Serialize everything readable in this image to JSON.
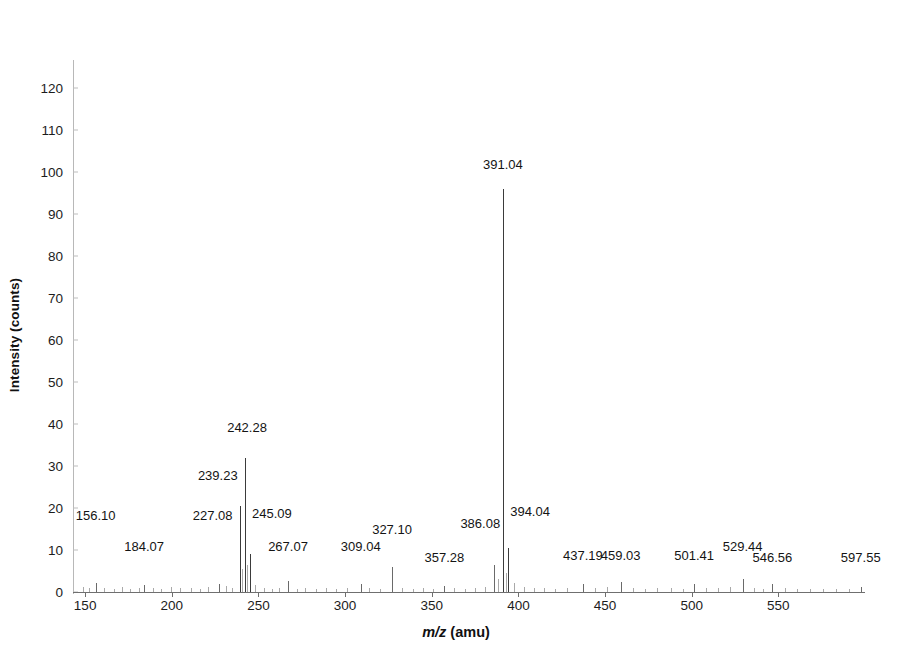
{
  "chart_data": {
    "type": "bar",
    "title": "",
    "subtitle": "",
    "xlabel": "m/z (amu)",
    "xlabel_italic_part": "m/z",
    "xlabel_plain_part": " (amu)",
    "ylabel": "Intensity (counts)",
    "xlim": [
      143,
      600
    ],
    "ylim": [
      0,
      125
    ],
    "x_ticks": [
      150,
      200,
      250,
      300,
      350,
      400,
      450,
      500,
      550
    ],
    "y_ticks": [
      0,
      10,
      20,
      30,
      40,
      50,
      60,
      70,
      80,
      90,
      100,
      110,
      120
    ],
    "grid": false,
    "legend": null,
    "peaks": [
      {
        "mz": 156.1,
        "intensity": 2.2,
        "label": "156.10",
        "label_y": 16.5,
        "label_dx": 0
      },
      {
        "mz": 184.07,
        "intensity": 1.6,
        "label": "184.07",
        "label_y": 9.0,
        "label_dx": 0
      },
      {
        "mz": 227.08,
        "intensity": 2.0,
        "label": "227.08",
        "label_y": 16.5,
        "label_dx": -6
      },
      {
        "mz": 239.23,
        "intensity": 20.5,
        "label": "239.23",
        "label_y": 26.0,
        "label_dx": -22
      },
      {
        "mz": 242.28,
        "intensity": 31.8,
        "label": "242.28",
        "label_y": 37.5,
        "label_dx": 2
      },
      {
        "mz": 245.09,
        "intensity": 9.0,
        "label": "245.09",
        "label_y": 17.0,
        "label_dx": 22
      },
      {
        "mz": 267.07,
        "intensity": 2.6,
        "label": "267.07",
        "label_y": 9.0,
        "label_dx": 0
      },
      {
        "mz": 309.04,
        "intensity": 1.8,
        "label": "309.04",
        "label_y": 9.0,
        "label_dx": 0
      },
      {
        "mz": 327.1,
        "intensity": 6.0,
        "label": "327.10",
        "label_y": 13.0,
        "label_dx": 0
      },
      {
        "mz": 357.28,
        "intensity": 1.5,
        "label": "357.28",
        "label_y": 6.5,
        "label_dx": 0
      },
      {
        "mz": 386.08,
        "intensity": 6.5,
        "label": "386.08",
        "label_y": 14.5,
        "label_dx": -14
      },
      {
        "mz": 391.04,
        "intensity": 96.0,
        "label": "391.04",
        "label_y": 100.0,
        "label_dx": 0
      },
      {
        "mz": 394.04,
        "intensity": 10.5,
        "label": "394.04",
        "label_y": 17.5,
        "label_dx": 22
      },
      {
        "mz": 437.19,
        "intensity": 2.0,
        "label": "437.19",
        "label_y": 7.0,
        "label_dx": 0
      },
      {
        "mz": 459.03,
        "intensity": 2.4,
        "label": "459.03",
        "label_y": 7.0,
        "label_dx": 0
      },
      {
        "mz": 501.41,
        "intensity": 1.8,
        "label": "501.41",
        "label_y": 7.0,
        "label_dx": 0
      },
      {
        "mz": 529.44,
        "intensity": 3.2,
        "label": "529.44",
        "label_y": 9.0,
        "label_dx": 0
      },
      {
        "mz": 546.56,
        "intensity": 2.0,
        "label": "546.56",
        "label_y": 6.5,
        "label_dx": 0
      },
      {
        "mz": 597.55,
        "intensity": 1.2,
        "label": "597.55",
        "label_y": 6.5,
        "label_dx": 0
      }
    ],
    "minor_peaks": [
      {
        "mz": 148.5,
        "intensity": 1.1
      },
      {
        "mz": 152.0,
        "intensity": 0.9
      },
      {
        "mz": 161.0,
        "intensity": 1.0
      },
      {
        "mz": 166.5,
        "intensity": 0.8
      },
      {
        "mz": 171.0,
        "intensity": 1.2
      },
      {
        "mz": 176.0,
        "intensity": 0.7
      },
      {
        "mz": 181.0,
        "intensity": 0.9
      },
      {
        "mz": 189.0,
        "intensity": 1.0
      },
      {
        "mz": 194.0,
        "intensity": 0.8
      },
      {
        "mz": 199.5,
        "intensity": 1.1
      },
      {
        "mz": 205.0,
        "intensity": 0.9
      },
      {
        "mz": 211.0,
        "intensity": 1.0
      },
      {
        "mz": 216.0,
        "intensity": 0.8
      },
      {
        "mz": 221.0,
        "intensity": 1.2
      },
      {
        "mz": 231.0,
        "intensity": 1.4
      },
      {
        "mz": 235.0,
        "intensity": 1.0
      },
      {
        "mz": 240.6,
        "intensity": 5.5
      },
      {
        "mz": 243.6,
        "intensity": 6.5
      },
      {
        "mz": 248.0,
        "intensity": 1.6
      },
      {
        "mz": 253.0,
        "intensity": 1.0
      },
      {
        "mz": 258.0,
        "intensity": 0.8
      },
      {
        "mz": 262.0,
        "intensity": 0.9
      },
      {
        "mz": 272.0,
        "intensity": 0.8
      },
      {
        "mz": 277.0,
        "intensity": 1.0
      },
      {
        "mz": 283.0,
        "intensity": 0.7
      },
      {
        "mz": 289.0,
        "intensity": 0.9
      },
      {
        "mz": 295.0,
        "intensity": 0.8
      },
      {
        "mz": 301.0,
        "intensity": 1.0
      },
      {
        "mz": 314.0,
        "intensity": 0.9
      },
      {
        "mz": 320.0,
        "intensity": 0.8
      },
      {
        "mz": 333.0,
        "intensity": 1.0
      },
      {
        "mz": 339.0,
        "intensity": 0.8
      },
      {
        "mz": 345.0,
        "intensity": 0.9
      },
      {
        "mz": 351.0,
        "intensity": 0.8
      },
      {
        "mz": 363.0,
        "intensity": 1.0
      },
      {
        "mz": 369.0,
        "intensity": 0.8
      },
      {
        "mz": 375.0,
        "intensity": 0.9
      },
      {
        "mz": 381.0,
        "intensity": 1.1
      },
      {
        "mz": 388.5,
        "intensity": 3.0
      },
      {
        "mz": 392.6,
        "intensity": 4.5
      },
      {
        "mz": 397.5,
        "intensity": 2.2
      },
      {
        "mz": 403.0,
        "intensity": 1.2
      },
      {
        "mz": 409.0,
        "intensity": 0.9
      },
      {
        "mz": 415.0,
        "intensity": 1.0
      },
      {
        "mz": 421.0,
        "intensity": 0.8
      },
      {
        "mz": 428.0,
        "intensity": 1.0
      },
      {
        "mz": 444.0,
        "intensity": 0.9
      },
      {
        "mz": 451.0,
        "intensity": 1.1
      },
      {
        "mz": 466.0,
        "intensity": 1.0
      },
      {
        "mz": 473.0,
        "intensity": 0.8
      },
      {
        "mz": 480.0,
        "intensity": 0.9
      },
      {
        "mz": 488.0,
        "intensity": 1.0
      },
      {
        "mz": 495.0,
        "intensity": 0.8
      },
      {
        "mz": 508.0,
        "intensity": 1.0
      },
      {
        "mz": 515.0,
        "intensity": 0.9
      },
      {
        "mz": 522.0,
        "intensity": 1.1
      },
      {
        "mz": 536.0,
        "intensity": 1.0
      },
      {
        "mz": 541.0,
        "intensity": 0.8
      },
      {
        "mz": 554.0,
        "intensity": 0.9
      },
      {
        "mz": 561.0,
        "intensity": 0.8
      },
      {
        "mz": 568.0,
        "intensity": 0.7
      },
      {
        "mz": 576.0,
        "intensity": 0.8
      },
      {
        "mz": 583.0,
        "intensity": 0.7
      },
      {
        "mz": 591.0,
        "intensity": 0.8
      }
    ]
  }
}
